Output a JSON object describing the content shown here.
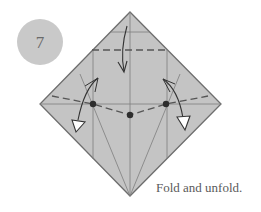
{
  "step": {
    "number": "7",
    "badge_color": "#c9c9c9"
  },
  "caption": "Fold and unfold.",
  "diagram": {
    "paper_color": "#c4c4c4",
    "edge_color": "#6e6e6e",
    "crease_color": "#7a7a7a",
    "valley_fold_color": "#555555",
    "shape": "diamond (square rotated 45°)",
    "vertices": {
      "top": [
        130,
        12
      ],
      "left": [
        40,
        104
      ],
      "right": [
        221,
        105
      ],
      "bottom": [
        130,
        196
      ]
    },
    "reference_points": [
      {
        "label": "left-dot",
        "x": 93,
        "y": 104
      },
      {
        "label": "center-dot",
        "x": 130,
        "y": 115
      },
      {
        "label": "right-dot",
        "x": 166,
        "y": 104
      }
    ],
    "arrows": [
      {
        "type": "fold-down",
        "description": "valley fold top flap down to dashed line"
      },
      {
        "type": "fold-and-unfold-left",
        "description": "hollow arrowhead pointing down on left"
      },
      {
        "type": "fold-and-unfold-right",
        "description": "hollow arrowhead pointing down on right"
      }
    ]
  }
}
